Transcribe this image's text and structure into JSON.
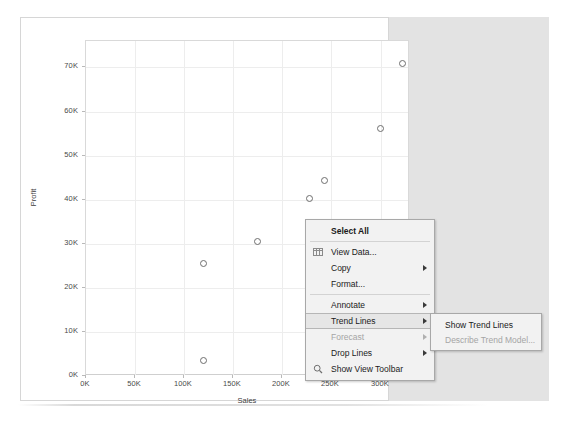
{
  "chart_data": {
    "type": "scatter",
    "title": "",
    "xlabel": "Sales",
    "ylabel": "Profit",
    "xlim": [
      0,
      330000
    ],
    "ylim": [
      0,
      76000
    ],
    "xticks": [
      "0K",
      "50K",
      "100K",
      "150K",
      "200K",
      "250K",
      "300K"
    ],
    "xtickvalues": [
      0,
      50000,
      100000,
      150000,
      200000,
      250000,
      300000
    ],
    "yticks": [
      "0K",
      "10K",
      "20K",
      "30K",
      "40K",
      "50K",
      "60K",
      "70K"
    ],
    "ytickvalues": [
      0,
      10000,
      20000,
      30000,
      40000,
      50000,
      60000,
      70000
    ],
    "grid": true,
    "legend": "none",
    "marker": "open-circle",
    "marker_color": "#6e6e6e",
    "points": [
      {
        "x": 120000,
        "y": 3500
      },
      {
        "x": 120000,
        "y": 25500
      },
      {
        "x": 175000,
        "y": 30500
      },
      {
        "x": 228000,
        "y": 7000
      },
      {
        "x": 228000,
        "y": 40200
      },
      {
        "x": 243000,
        "y": 44300
      },
      {
        "x": 300000,
        "y": 56200
      },
      {
        "x": 322000,
        "y": 70800
      }
    ]
  },
  "context_menu": {
    "items": [
      {
        "label": "Select All",
        "icon": "",
        "bold": true,
        "disabled": false,
        "submenu": false,
        "highlighted": false,
        "separator_after": true
      },
      {
        "label": "View Data...",
        "icon": "grid-icon",
        "bold": false,
        "disabled": false,
        "submenu": false,
        "highlighted": false,
        "separator_after": false
      },
      {
        "label": "Copy",
        "icon": "",
        "bold": false,
        "disabled": false,
        "submenu": true,
        "highlighted": false,
        "separator_after": false
      },
      {
        "label": "Format...",
        "icon": "",
        "bold": false,
        "disabled": false,
        "submenu": false,
        "highlighted": false,
        "separator_after": true
      },
      {
        "label": "Annotate",
        "icon": "",
        "bold": false,
        "disabled": false,
        "submenu": true,
        "highlighted": false,
        "separator_after": false
      },
      {
        "label": "Trend Lines",
        "icon": "",
        "bold": false,
        "disabled": false,
        "submenu": true,
        "highlighted": true,
        "separator_after": false
      },
      {
        "label": "Forecast",
        "icon": "",
        "bold": false,
        "disabled": true,
        "submenu": true,
        "highlighted": false,
        "separator_after": false
      },
      {
        "label": "Drop Lines",
        "icon": "",
        "bold": false,
        "disabled": false,
        "submenu": true,
        "highlighted": false,
        "separator_after": false
      },
      {
        "label": "Show View Toolbar",
        "icon": "magnifier-icon",
        "bold": false,
        "disabled": false,
        "submenu": false,
        "highlighted": false,
        "separator_after": false
      }
    ]
  },
  "submenu": {
    "parent": "Trend Lines",
    "items": [
      {
        "label": "Show Trend Lines",
        "disabled": false
      },
      {
        "label": "Describe Trend Model...",
        "disabled": true
      }
    ]
  },
  "colors": {
    "menu_background": "#f2f2f2",
    "menu_border": "#a8a8a8",
    "highlight": "#e6e6e6",
    "disabled_text": "#a5a5a5",
    "marker": "#6e6e6e",
    "gridline": "#ededed",
    "right_pane": "#e3e3e3"
  }
}
